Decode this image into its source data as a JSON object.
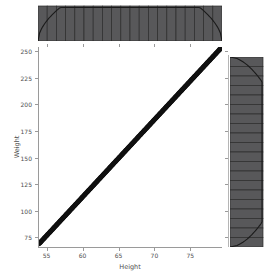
{
  "figure": {
    "kind": "seaborn-jointplot",
    "background_color": "#ffffff"
  },
  "style": {
    "bar_fill_color": "#58585a",
    "bar_edge_color": "#2b2b2b",
    "kde_line_color": "#1a1a1a",
    "scatter_color": "#111111",
    "axis_color": "#9a9a9a",
    "tick_label_color": "#4d4d4d"
  },
  "axis_labels": {
    "x": "Height",
    "y": "Weight"
  },
  "ticks": {
    "x": [
      "55",
      "60",
      "65",
      "70",
      "75"
    ],
    "y": [
      "75",
      "100",
      "125",
      "150",
      "175",
      "200",
      "225",
      "250"
    ]
  },
  "chart_data": {
    "type": "scatter",
    "title": "",
    "subtitle": "",
    "xlabel": "Height",
    "ylabel": "Weight",
    "xlim": [
      53.8,
      79.4
    ],
    "ylim": [
      66.0,
      254.0
    ],
    "xticks": [
      55,
      60,
      65,
      70,
      75
    ],
    "yticks": [
      75,
      100,
      125,
      150,
      175,
      200,
      225,
      250
    ],
    "grid": false,
    "legend": null,
    "annotations": [],
    "relationship": "perfectly linear, Weight increases monotonically with Height",
    "x": [
      54.2,
      55.5,
      56.8,
      58.1,
      59.4,
      60.7,
      62.0,
      63.3,
      64.6,
      65.9,
      67.2,
      68.5,
      69.8,
      71.1,
      72.4,
      73.7,
      75.0,
      76.3,
      77.6,
      78.9
    ],
    "y": [
      70.0,
      79.3,
      88.6,
      97.9,
      107.2,
      116.5,
      125.8,
      135.1,
      144.4,
      153.7,
      163.0,
      172.3,
      181.6,
      190.9,
      200.2,
      209.5,
      218.8,
      228.1,
      237.4,
      246.7
    ],
    "marginals": [
      {
        "name": "marginal-x-histogram",
        "type": "bar",
        "orientation": "vertical",
        "position": "top",
        "variable": "Height",
        "bins": 20,
        "categories": [
          "54.2",
          "55.5",
          "56.8",
          "58.1",
          "59.4",
          "60.7",
          "62.0",
          "63.3",
          "64.6",
          "65.9",
          "67.2",
          "68.5",
          "69.8",
          "71.1",
          "72.4",
          "73.7",
          "75.0",
          "76.3",
          "77.6",
          "78.9"
        ],
        "values": [
          1,
          1,
          1,
          1,
          1,
          1,
          1,
          1,
          1,
          1,
          1,
          1,
          1,
          1,
          1,
          1,
          1,
          1,
          1,
          1
        ],
        "kde_overlay": true,
        "kde_shape": "flat plateau with rounded roll-off at both edges"
      },
      {
        "name": "marginal-y-histogram",
        "type": "bar",
        "orientation": "horizontal",
        "position": "right",
        "variable": "Weight",
        "bins": 20,
        "categories": [
          "70.0",
          "79.3",
          "88.6",
          "97.9",
          "107.2",
          "116.5",
          "125.8",
          "135.1",
          "144.4",
          "153.7",
          "163.0",
          "172.3",
          "181.6",
          "190.9",
          "200.2",
          "209.5",
          "218.8",
          "228.1",
          "237.4",
          "246.7"
        ],
        "values": [
          1,
          1,
          1,
          1,
          1,
          1,
          1,
          1,
          1,
          1,
          1,
          1,
          1,
          1,
          1,
          1,
          1,
          1,
          1,
          1
        ],
        "kde_overlay": true,
        "kde_shape": "flat plateau with rounded roll-off at both edges"
      }
    ]
  }
}
